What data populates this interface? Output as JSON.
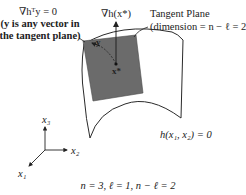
{
  "diagram": {
    "labels": {
      "orthogonality_line1": "∇hᵀy = 0",
      "orthogonality_line2": "(y is any vector in",
      "orthogonality_line3": "the tangent plane)",
      "gradient": "∇h(x*)",
      "tangent_plane_line1": "Tangent Plane",
      "tangent_plane_line2": "(dimension = n − ℓ = 2)",
      "surface": "h(x₁, x₂) = 0",
      "point": "x*",
      "vector_y": "y",
      "axis_x1": "x₁",
      "axis_x2": "x₂",
      "axis_x3": "x₃",
      "caption": "n = 3, ℓ = 1, n − ℓ = 2"
    },
    "colors": {
      "tangent_plane_fill": "#6b6b6b",
      "outline": "#2a2a2a",
      "background": "#ffffff"
    }
  }
}
